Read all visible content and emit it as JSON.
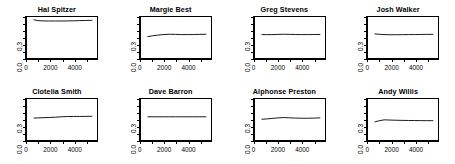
{
  "figure": {
    "layout": "2 rows x 4 columns of small-multiple line panels",
    "background_color": "#ffffff",
    "line_color": "#000000",
    "axis_color": "#000000"
  },
  "chart_data": [
    {
      "type": "line",
      "title": "Hal Spitzer",
      "xlabel": "",
      "ylabel": "",
      "xlim": [
        0,
        5900
      ],
      "ylim": [
        0.0,
        0.62
      ],
      "xticks": [
        0,
        2000,
        4000
      ],
      "xtick_labels": [
        "0",
        "2000",
        "4000"
      ],
      "yticks": [
        0.0,
        0.3
      ],
      "ytick_labels": [
        "0.0",
        "0.3"
      ],
      "grid": false,
      "legend": "none",
      "x": [
        650,
        1000,
        1400,
        1900,
        2400,
        2900,
        3400,
        3900,
        4400,
        4900,
        5400
      ],
      "y": [
        0.565,
        0.553,
        0.549,
        0.548,
        0.548,
        0.548,
        0.549,
        0.551,
        0.553,
        0.556,
        0.558
      ]
    },
    {
      "type": "line",
      "title": "Margie Best",
      "xlabel": "",
      "ylabel": "",
      "xlim": [
        0,
        5900
      ],
      "ylim": [
        0.0,
        0.62
      ],
      "xticks": [
        0,
        2000,
        4000
      ],
      "xtick_labels": [
        "0",
        "2000",
        "4000"
      ],
      "yticks": [
        0.0,
        0.3
      ],
      "ytick_labels": [
        "0.0",
        "0.3"
      ],
      "grid": false,
      "legend": "none",
      "x": [
        650,
        1000,
        1400,
        1900,
        2400,
        2900,
        3400,
        3900,
        4400,
        4900,
        5400
      ],
      "y": [
        0.323,
        0.334,
        0.343,
        0.352,
        0.357,
        0.355,
        0.352,
        0.352,
        0.353,
        0.355,
        0.357
      ]
    },
    {
      "type": "line",
      "title": "Greg Stevens",
      "xlabel": "",
      "ylabel": "",
      "xlim": [
        0,
        5900
      ],
      "ylim": [
        0.0,
        0.62
      ],
      "xticks": [
        0,
        2000,
        4000
      ],
      "xtick_labels": [
        "0",
        "2000",
        "4000"
      ],
      "yticks": [
        0.0,
        0.3
      ],
      "ytick_labels": [
        "0.0",
        "0.3"
      ],
      "grid": false,
      "legend": "none",
      "x": [
        650,
        1000,
        1400,
        1900,
        2400,
        2900,
        3400,
        3900,
        4400,
        4900,
        5400
      ],
      "y": [
        0.352,
        0.352,
        0.351,
        0.354,
        0.357,
        0.355,
        0.353,
        0.352,
        0.352,
        0.353,
        0.354
      ]
    },
    {
      "type": "line",
      "title": "Josh Walker",
      "xlabel": "",
      "ylabel": "",
      "xlim": [
        0,
        5900
      ],
      "ylim": [
        0.0,
        0.62
      ],
      "xticks": [
        0,
        2000,
        4000
      ],
      "xtick_labels": [
        "0",
        "2000",
        "4000"
      ],
      "yticks": [
        0.0,
        0.3
      ],
      "ytick_labels": [
        "0.0",
        "0.3"
      ],
      "grid": false,
      "legend": "none",
      "x": [
        650,
        1000,
        1400,
        1900,
        2400,
        2900,
        3400,
        3900,
        4400,
        4900,
        5400
      ],
      "y": [
        0.362,
        0.356,
        0.352,
        0.35,
        0.35,
        0.351,
        0.352,
        0.353,
        0.354,
        0.355,
        0.356
      ]
    },
    {
      "type": "line",
      "title": "Clotelia Smith",
      "xlabel": "",
      "ylabel": "",
      "xlim": [
        0,
        5900
      ],
      "ylim": [
        0.0,
        0.62
      ],
      "xticks": [
        0,
        2000,
        4000
      ],
      "xtick_labels": [
        "0",
        "2000",
        "4000"
      ],
      "yticks": [
        0.0,
        0.3
      ],
      "ytick_labels": [
        "0.0",
        "0.3"
      ],
      "grid": false,
      "legend": "none",
      "x": [
        650,
        1000,
        1400,
        1900,
        2400,
        2900,
        3400,
        3900,
        4400,
        4900,
        5400
      ],
      "y": [
        0.331,
        0.333,
        0.336,
        0.339,
        0.343,
        0.349,
        0.353,
        0.354,
        0.354,
        0.355,
        0.356
      ]
    },
    {
      "type": "line",
      "title": "Dave Barron",
      "xlabel": "",
      "ylabel": "",
      "xlim": [
        0,
        5900
      ],
      "ylim": [
        0.0,
        0.62
      ],
      "xticks": [
        0,
        2000,
        4000
      ],
      "xtick_labels": [
        "0",
        "2000",
        "4000"
      ],
      "yticks": [
        0.0,
        0.3
      ],
      "ytick_labels": [
        "0.0",
        "0.3"
      ],
      "grid": false,
      "legend": "none",
      "x": [
        650,
        1000,
        1400,
        1900,
        2400,
        2900,
        3400,
        3900,
        4400,
        4900,
        5400
      ],
      "y": [
        0.349,
        0.349,
        0.349,
        0.349,
        0.349,
        0.349,
        0.349,
        0.349,
        0.349,
        0.349,
        0.349
      ]
    },
    {
      "type": "line",
      "title": "Alphonse Preston",
      "xlabel": "",
      "ylabel": "",
      "xlim": [
        0,
        5900
      ],
      "ylim": [
        0.0,
        0.62
      ],
      "xticks": [
        0,
        2000,
        4000
      ],
      "xtick_labels": [
        "0",
        "2000",
        "4000"
      ],
      "yticks": [
        0.0,
        0.3
      ],
      "ytick_labels": [
        "0.0",
        "0.3"
      ],
      "grid": false,
      "legend": "none",
      "x": [
        650,
        1000,
        1400,
        1900,
        2400,
        2900,
        3400,
        3900,
        4400,
        4900,
        5400
      ],
      "y": [
        0.314,
        0.318,
        0.324,
        0.332,
        0.338,
        0.335,
        0.33,
        0.328,
        0.328,
        0.33,
        0.334
      ]
    },
    {
      "type": "line",
      "title": "Andy Willis",
      "xlabel": "",
      "ylabel": "",
      "xlim": [
        0,
        5900
      ],
      "ylim": [
        0.0,
        0.62
      ],
      "xticks": [
        0,
        2000,
        4000
      ],
      "xtick_labels": [
        "0",
        "2000",
        "4000"
      ],
      "yticks": [
        0.0,
        0.3
      ],
      "ytick_labels": [
        "0.0",
        "0.3"
      ],
      "grid": false,
      "legend": "none",
      "x": [
        650,
        1000,
        1400,
        1900,
        2400,
        2900,
        3400,
        3900,
        4400,
        4900,
        5400
      ],
      "y": [
        0.276,
        0.292,
        0.305,
        0.302,
        0.299,
        0.297,
        0.296,
        0.295,
        0.294,
        0.293,
        0.293
      ]
    }
  ]
}
